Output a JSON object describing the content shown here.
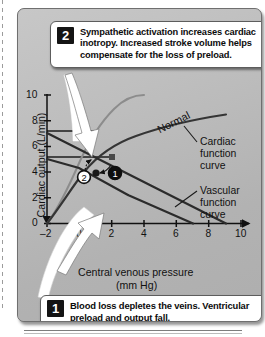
{
  "figure": {
    "callouts": [
      {
        "number": "2",
        "text": "Sympathetic activation increases cardiac inotropy. Increased stroke volume helps compensate for the loss of preload."
      },
      {
        "number": "1",
        "text": "Blood loss depletes the veins. Ventricular preload and output fall."
      }
    ],
    "annotations": {
      "normal": "Normal",
      "cardiac_curve": "Cardiac function curve",
      "vascular_curve": "Vascular function curve",
      "point_1": "1",
      "point_2": "2"
    }
  },
  "chart_data": {
    "type": "line",
    "title": "",
    "xlabel_line1": "Central venous pressure",
    "xlabel_line2": "(mm Hg)",
    "ylabel": "Cardiac output (L/min)",
    "xlim": [
      -2,
      10
    ],
    "ylim": [
      0,
      10
    ],
    "xticks": [
      -2,
      0,
      2,
      4,
      6,
      8,
      10
    ],
    "xtick_labels": [
      "–2",
      "0",
      "2",
      "4",
      "6",
      "8",
      "10"
    ],
    "yticks": [
      0,
      2,
      4,
      6,
      8,
      10
    ],
    "ytick_labels": [
      "0",
      "2",
      "4",
      "6",
      "8",
      "10"
    ],
    "grid": false,
    "legend": "none",
    "series": [
      {
        "name": "Normal cardiac function curve",
        "style": "solid-dark",
        "points": [
          [
            -2,
            0.0
          ],
          [
            -1.5,
            1.4
          ],
          [
            -1,
            2.7
          ],
          [
            -0.5,
            3.8
          ],
          [
            0,
            4.8
          ],
          [
            0.5,
            5.5
          ],
          [
            1,
            6.1
          ],
          [
            2,
            6.9
          ],
          [
            3,
            7.4
          ],
          [
            4,
            7.8
          ],
          [
            5,
            8.0
          ],
          [
            6,
            8.2
          ],
          [
            7,
            8.35
          ],
          [
            8,
            8.5
          ]
        ]
      },
      {
        "name": "Enhanced (sympathetic) cardiac function curve",
        "style": "solid-light",
        "points": [
          [
            -2,
            0.0
          ],
          [
            -1.6,
            1.2
          ],
          [
            -1.2,
            2.6
          ],
          [
            -0.8,
            3.9
          ],
          [
            -0.4,
            5.1
          ],
          [
            0,
            6.2
          ],
          [
            0.5,
            7.2
          ],
          [
            1,
            8.0
          ],
          [
            1.5,
            8.7
          ],
          [
            2,
            9.2
          ],
          [
            2.6,
            9.7
          ],
          [
            3.2,
            10.0
          ]
        ]
      },
      {
        "name": "Normal vascular function curve",
        "style": "solid-dark",
        "points": [
          [
            -2,
            7.0
          ],
          [
            2,
            5.0
          ],
          [
            5,
            2.6
          ],
          [
            7,
            0.0
          ]
        ]
      },
      {
        "name": "Hemorrhage vascular function curve",
        "style": "solid-dark",
        "points": [
          [
            -2,
            5.0
          ],
          [
            0,
            4.4
          ],
          [
            1,
            3.8
          ],
          [
            3,
            2.2
          ],
          [
            5,
            0.0
          ]
        ]
      }
    ],
    "operating_points": [
      {
        "label": "1",
        "x": 2.0,
        "y": 5.0,
        "note": "normal operating point"
      },
      {
        "label": "2",
        "x": 1.0,
        "y": 3.8,
        "note": "after blood loss"
      }
    ],
    "reference_lines": [
      {
        "type": "horizontal",
        "y": 7.0
      },
      {
        "type": "horizontal",
        "y": 5.0
      }
    ]
  }
}
